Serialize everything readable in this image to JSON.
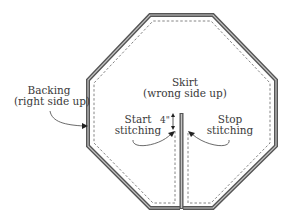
{
  "diagram": {
    "shape": "octagon",
    "labels": {
      "backing_line1": "Backing",
      "backing_line2": "(right side up)",
      "skirt_line1": "Skirt",
      "skirt_line2": "(wrong side up)",
      "start_line1": "Start",
      "start_line2": "stitching",
      "stop_line1": "Stop",
      "stop_line2": "stitching",
      "measurement": "4\""
    },
    "colors": {
      "border": "#555555",
      "border_highlight": "#bdbdbd",
      "stitch_line": "#666666",
      "text": "#3a3a3a",
      "background": "#ffffff"
    }
  }
}
